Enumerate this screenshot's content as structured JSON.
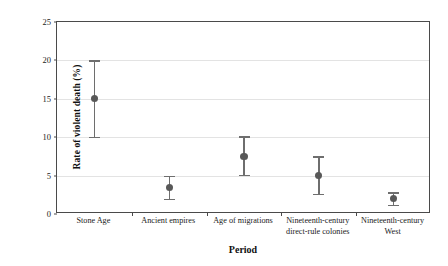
{
  "chart_data": {
    "type": "scatter",
    "title": "",
    "xlabel": "Period",
    "ylabel": "Rate of violent death (%)",
    "ylim": [
      0,
      25
    ],
    "yticks": [
      0,
      5,
      10,
      15,
      20,
      25
    ],
    "ytick_labels": [
      "0",
      "5",
      "10",
      "15",
      "20",
      "25"
    ],
    "grid": "horizontal",
    "legend": "none",
    "categories": [
      "Stone Age",
      "Ancient empires",
      "Age of migrations",
      "Nineteenth-century direct-rule colonies",
      "Nineteenth-century West"
    ],
    "category_label_lines": [
      [
        "Stone Age"
      ],
      [
        "Ancient empires"
      ],
      [
        "Age of migrations"
      ],
      [
        "Nineteenth-century",
        "direct-rule colonies"
      ],
      [
        "Nineteenth-century",
        "West"
      ]
    ],
    "values": [
      15.0,
      3.5,
      7.5,
      5.0,
      2.0
    ],
    "error_low": [
      10.0,
      2.0,
      5.1,
      2.6,
      1.2
    ],
    "error_high": [
      20.0,
      5.0,
      10.1,
      7.5,
      2.8
    ],
    "marker_color": "#585858",
    "errorbar_color": "#6e6e6e",
    "gridline_color": "#e3e3e3",
    "axis_color": "#4a4a4a",
    "background_color": "#ffffff"
  }
}
